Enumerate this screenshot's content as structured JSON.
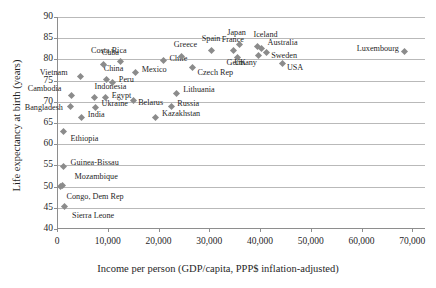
{
  "chart_data": {
    "type": "scatter",
    "title": "",
    "xlabel": "Income per person (GDP/capita, PPP$ inflation-adjusted)",
    "ylabel": "Life expectancy at birth (years)",
    "xlim": [
      0,
      72500
    ],
    "ylim": [
      40,
      90
    ],
    "xticks": [
      0,
      10000,
      20000,
      30000,
      40000,
      50000,
      60000,
      70000
    ],
    "xticklabels": [
      "0",
      "10,000",
      "20,000",
      "30,000",
      "40,000",
      "50,000",
      "60,000",
      "70,000"
    ],
    "yticks": [
      40,
      45,
      50,
      55,
      60,
      65,
      70,
      75,
      80,
      85,
      90
    ],
    "yticklabels": [
      "40",
      "45",
      "50",
      "55",
      "60",
      "65",
      "70",
      "75",
      "80",
      "85",
      "90"
    ],
    "grid": "horizontal",
    "legend": "none",
    "marker": "diamond",
    "marker_color": "#8b8b8b",
    "points": [
      {
        "label": "Sierra Leone",
        "x": 1400,
        "y": 45.3,
        "lx": 8,
        "ly": 9
      },
      {
        "label": "Congo, Dem Rep",
        "x": 700,
        "y": 50.0,
        "lx": 6,
        "ly": 10
      },
      {
        "label": "Mozambique",
        "x": 1100,
        "y": 50.2,
        "lx": 12,
        "ly": -9
      },
      {
        "label": "Guinea-Bissau",
        "x": 1300,
        "y": 54.8,
        "lx": 7,
        "ly": -3
      },
      {
        "label": "Ethiopia",
        "x": 1300,
        "y": 63.0,
        "lx": 7,
        "ly": 8
      },
      {
        "label": "India",
        "x": 4900,
        "y": 66.2,
        "lx": 6,
        "ly": -3
      },
      {
        "label": "Bangladesh",
        "x": 2700,
        "y": 68.9,
        "lx": -46,
        "ly": 2
      },
      {
        "label": "Kazakhstan",
        "x": 19500,
        "y": 66.3,
        "lx": 6,
        "ly": -3
      },
      {
        "label": "Ukraine",
        "x": 7600,
        "y": 68.7,
        "lx": 6,
        "ly": -3
      },
      {
        "label": "Russia",
        "x": 22500,
        "y": 68.8,
        "lx": 6,
        "ly": -3
      },
      {
        "label": "Egypt",
        "x": 9600,
        "y": 70.9,
        "lx": 6,
        "ly": -2
      },
      {
        "label": "Belarus",
        "x": 15000,
        "y": 70.3,
        "lx": 5,
        "ly": 2
      },
      {
        "label": "Indonesia",
        "x": 7400,
        "y": 71.1,
        "lx": 0,
        "ly": -10
      },
      {
        "label": "Lithuania",
        "x": 23500,
        "y": 72.0,
        "lx": 7,
        "ly": -3
      },
      {
        "label": "Cambodia",
        "x": 2900,
        "y": 71.5,
        "lx": -44,
        "ly": -6
      },
      {
        "label": "Peru",
        "x": 11000,
        "y": 74.5,
        "lx": 6,
        "ly": -3
      },
      {
        "label": "Vietnam",
        "x": 4700,
        "y": 76.0,
        "lx": -41,
        "ly": -3
      },
      {
        "label": "China",
        "x": 9800,
        "y": 75.2,
        "lx": -3,
        "ly": -11
      },
      {
        "label": "Mexico",
        "x": 15500,
        "y": 77.0,
        "lx": 6,
        "ly": -2
      },
      {
        "label": "Cuba",
        "x": 9200,
        "y": 78.8,
        "lx": -2,
        "ly": -11
      },
      {
        "label": "Costa Rica",
        "x": 12600,
        "y": 79.6,
        "lx": -30,
        "ly": -10
      },
      {
        "label": "Chile",
        "x": 21000,
        "y": 79.8,
        "lx": 6,
        "ly": -1
      },
      {
        "label": "Czech Rep",
        "x": 26700,
        "y": 78.1,
        "lx": 5,
        "ly": 6
      },
      {
        "label": "Greece",
        "x": 24600,
        "y": 80.7,
        "lx": -8,
        "ly": -11
      },
      {
        "label": "Spain",
        "x": 30500,
        "y": 82.2,
        "lx": -10,
        "ly": -11
      },
      {
        "label": "France",
        "x": 34800,
        "y": 82.0,
        "lx": -12,
        "ly": -11
      },
      {
        "label": "UK",
        "x": 35500,
        "y": 80.4,
        "lx": -3,
        "ly": 5
      },
      {
        "label": "Japan",
        "x": 35900,
        "y": 83.5,
        "lx": -12,
        "ly": -12
      },
      {
        "label": "Iceland",
        "x": 39500,
        "y": 83.0,
        "lx": -4,
        "ly": -12
      },
      {
        "label": "Australia",
        "x": 40300,
        "y": 82.5,
        "lx": 6,
        "ly": -6
      },
      {
        "label": "Sweden",
        "x": 41200,
        "y": 81.7,
        "lx": 5,
        "ly": 4
      },
      {
        "label": "Germany",
        "x": 39700,
        "y": 80.9,
        "lx": -32,
        "ly": 7
      },
      {
        "label": "USA",
        "x": 44500,
        "y": 79.1,
        "lx": 4,
        "ly": 5
      },
      {
        "label": "Luxembourg",
        "x": 68500,
        "y": 81.9,
        "lx": -48,
        "ly": -2
      }
    ]
  }
}
